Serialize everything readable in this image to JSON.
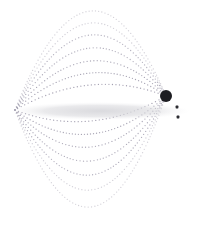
{
  "figure": {
    "width": 201,
    "height": 229,
    "background_color": "#ffffff"
  },
  "colors": {
    "field_line": "#9a96a8",
    "field_line_faint": "#bdbac6",
    "disc_core": "#d8d8dc",
    "disc_edge": "#f0f0f2",
    "body_marker": "#1d1d22",
    "small_marker": "#2a2a30",
    "background": "#ffffff"
  },
  "chart_data": {
    "type": "scatter",
    "title": "",
    "subtitle": "",
    "xlabel": "",
    "ylabel": "",
    "xlim": [
      0,
      201
    ],
    "ylim": [
      0,
      229
    ],
    "grid": false,
    "legend": false,
    "legend_position": "none",
    "annotations": [],
    "poles": {
      "left": {
        "x": 15,
        "y": 110,
        "label": "left-pole-convergence"
      },
      "right": {
        "x": 166,
        "y": 96,
        "label": "right-pole-convergence"
      }
    },
    "series": [
      {
        "name": "field-lines-dotted-arcs",
        "style": "dotted",
        "color": "#9a96a8",
        "dot_radius": 0.65,
        "dot_spacing": 3.0,
        "count_upper": 7,
        "count_lower": 7,
        "note": "Closed dipole field lines spanning from the left pole to the right pole, nested with increasing apex offset.",
        "upper_apex_offsets": [
          18,
          30,
          42,
          55,
          68,
          80,
          92
        ],
        "lower_apex_offsets": [
          18,
          31,
          44,
          58,
          72,
          87,
          104
        ]
      },
      {
        "name": "equatorial-disc",
        "style": "filled-lens",
        "color": "#d8d8dc",
        "center_x": 100,
        "center_y": 111,
        "half_width": 90,
        "half_height": 9,
        "note": "Faint elongated lens-shaped disc along the magnetic equator."
      },
      {
        "name": "primary-body-marker",
        "style": "filled-circle",
        "color": "#1d1d22",
        "x": 166,
        "y": 96,
        "radius": 6.0
      },
      {
        "name": "satellite-marker-upper",
        "style": "filled-square",
        "color": "#2a2a30",
        "x": 177,
        "y": 107,
        "size": 2.8
      },
      {
        "name": "satellite-marker-lower",
        "style": "filled-square",
        "color": "#2a2a30",
        "x": 178,
        "y": 117,
        "size": 2.8
      }
    ]
  }
}
